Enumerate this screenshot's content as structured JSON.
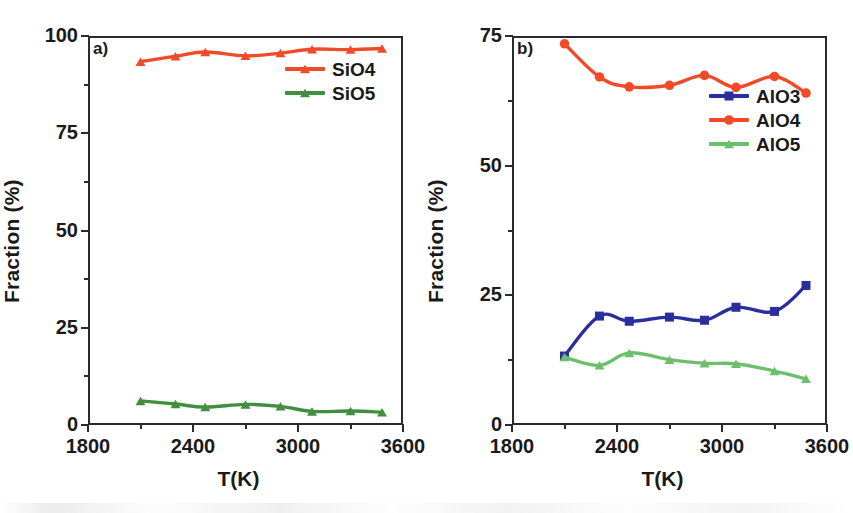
{
  "figure": {
    "width": 848,
    "height": 513,
    "background": "#ffffff"
  },
  "chart_data": [
    {
      "type": "line",
      "panel_tag": "a)",
      "title": "",
      "xlabel": "T(K)",
      "ylabel": "Fraction (%)",
      "xlim": [
        1800,
        3600
      ],
      "ylim": [
        0,
        100
      ],
      "xticks": [
        1800,
        2400,
        3000,
        3600
      ],
      "xtick_labels": [
        "1800",
        "2400",
        "3000",
        "3600"
      ],
      "yticks": [
        0,
        25,
        50,
        75,
        100
      ],
      "ytick_labels": [
        "0",
        "25",
        "50",
        "75",
        "100"
      ],
      "x_minor_ticks": [
        2100,
        2700,
        3300
      ],
      "y_minor_ticks": [
        12.5,
        37.5,
        62.5,
        87.5
      ],
      "grid": false,
      "legend_position": "upper right",
      "x": [
        2100,
        2300,
        2470,
        2700,
        2900,
        3080,
        3300,
        3480
      ],
      "series": [
        {
          "name": "SiO4",
          "color": "#f04b28",
          "marker": "triangle",
          "values": [
            93.4,
            94.8,
            95.9,
            94.9,
            95.6,
            96.6,
            96.5,
            96.8
          ]
        },
        {
          "name": "SiO5",
          "color": "#3f8f3f",
          "marker": "triangle",
          "values": [
            6.2,
            5.4,
            4.6,
            5.3,
            4.8,
            3.5,
            3.6,
            3.3
          ]
        }
      ]
    },
    {
      "type": "line",
      "panel_tag": "b)",
      "title": "",
      "xlabel": "T(K)",
      "ylabel": "Fraction (%)",
      "xlim": [
        1800,
        3600
      ],
      "ylim": [
        0,
        75
      ],
      "xticks": [
        1800,
        2400,
        3000,
        3600
      ],
      "xtick_labels": [
        "1800",
        "2400",
        "3000",
        "3600"
      ],
      "yticks": [
        0,
        25,
        50,
        75
      ],
      "ytick_labels": [
        "0",
        "25",
        "50",
        "75"
      ],
      "x_minor_ticks": [
        2100,
        2700,
        3300
      ],
      "y_minor_ticks": [
        12.5,
        37.5,
        62.5
      ],
      "grid": false,
      "legend_position": "upper right",
      "x": [
        2100,
        2300,
        2470,
        2700,
        2900,
        3080,
        3300,
        3480
      ],
      "series": [
        {
          "name": "AlO3",
          "color": "#2b2f9e",
          "marker": "square",
          "values": [
            13.3,
            21.0,
            20.0,
            20.8,
            20.2,
            22.7,
            21.9,
            26.9
          ]
        },
        {
          "name": "AlO4",
          "color": "#f04b28",
          "marker": "circle",
          "values": [
            73.5,
            67.1,
            65.2,
            65.5,
            67.4,
            65.1,
            67.2,
            64.0
          ]
        },
        {
          "name": "AlO5",
          "color": "#6cc06c",
          "marker": "triangle",
          "values": [
            13.1,
            11.5,
            13.9,
            12.6,
            11.9,
            11.8,
            10.4,
            8.9
          ]
        }
      ]
    }
  ],
  "colors": {
    "axis": "#2b2b2b",
    "sio4": "#f04b28",
    "sio5": "#3f8f3f",
    "alo3": "#2b2f9e",
    "alo4": "#f04b28",
    "alo5": "#6cc06c"
  }
}
